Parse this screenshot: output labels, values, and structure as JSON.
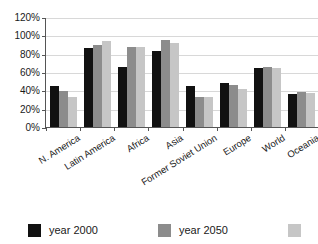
{
  "chart_data": {
    "type": "bar",
    "title": "",
    "xlabel": "",
    "ylabel": "",
    "ylim": [
      0,
      120
    ],
    "ytick_labels": [
      "0%",
      "20%",
      "40%",
      "60%",
      "80%",
      "100%",
      "120%"
    ],
    "ytick_values": [
      0,
      20,
      40,
      60,
      80,
      100,
      120
    ],
    "grid": true,
    "legend_position": "bottom",
    "categories": [
      "N. America",
      "Latin America",
      "Africa",
      "Asia",
      "Former Soviet Union",
      "Europe",
      "World",
      "Oceania"
    ],
    "series": [
      {
        "name": "year 2000",
        "color": "#111111",
        "values": [
          45,
          86,
          65,
          83,
          45,
          48,
          64,
          36
        ]
      },
      {
        "name": "year 2050",
        "color": "#8c8c8c",
        "values": [
          39,
          90,
          87,
          95,
          33,
          46,
          66,
          38
        ]
      },
      {
        "name": "",
        "color": "#c6c6c6",
        "values": [
          33,
          94,
          87,
          92,
          33,
          41,
          64,
          37
        ]
      }
    ]
  },
  "legend": {
    "items": [
      {
        "label": "year 2000",
        "color": "#111111"
      },
      {
        "label": "year 2050",
        "color": "#8c8c8c"
      },
      {
        "label": "",
        "color": "#c6c6c6"
      }
    ]
  }
}
